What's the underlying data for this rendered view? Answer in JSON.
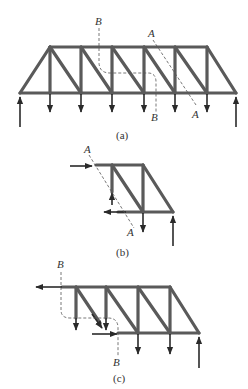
{
  "figures": [
    {
      "id": "a",
      "caption": "(a)",
      "section_labels": {
        "A_top": "A",
        "A_bottom": "A",
        "B_top": "B",
        "B_bottom": "B"
      }
    },
    {
      "id": "b",
      "caption": "(b)",
      "section_labels": {
        "A_top": "A",
        "A_bottom": "A"
      }
    },
    {
      "id": "c",
      "caption": "(c)",
      "section_labels": {
        "B_top": "B",
        "B_bottom": "B"
      }
    }
  ],
  "colors": {
    "member": "#5a5a5a",
    "arrow": "#2a2a2a",
    "background": "#ffffff"
  }
}
